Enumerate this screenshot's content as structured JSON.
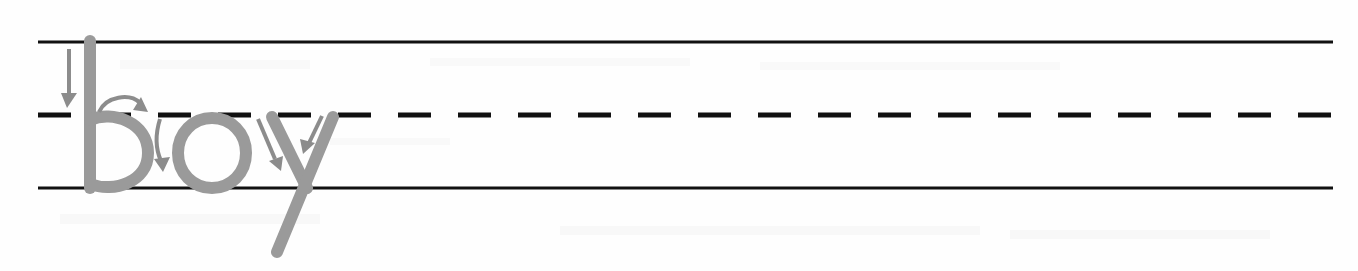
{
  "page": {
    "background_color": "#fefefe",
    "width": 1358,
    "height": 271
  },
  "worksheet": {
    "type": "manuscript-handwriting-practice",
    "word": "boy",
    "letters": [
      "b",
      "o",
      "y"
    ],
    "letter_color": "#9a9a9a",
    "line_color": "#111111",
    "arrow_color": "#8c8c8c",
    "description": "Traceable gray word 'boy' on three-line handwriting guide with numbered stroke-direction arrows"
  },
  "guide_lines": {
    "left_x": 38,
    "right_x": 1333,
    "top_line": {
      "name": "top-solid-line",
      "y": 42,
      "style": "solid",
      "thickness": 3,
      "label": "ascender line"
    },
    "mid_line": {
      "name": "middle-dashed-line",
      "y": 115,
      "style": "dashed",
      "thickness": 5,
      "dash_length": 33,
      "gap_length": 27,
      "label": "midline"
    },
    "baseline": {
      "name": "bottom-solid-line",
      "y": 188,
      "style": "solid",
      "thickness": 3,
      "label": "baseline"
    }
  },
  "strokes": [
    {
      "id": "b-stem",
      "letter": "b",
      "order": 1,
      "description": "vertical downstroke from top line to baseline",
      "color": "#9a9a9a",
      "width": 12,
      "path": "M 90 41 L 90 188"
    },
    {
      "id": "b-bowl",
      "letter": "b",
      "order": 2,
      "description": "round bowl from midline clockwise back to baseline",
      "color": "#9a9a9a",
      "width": 12,
      "path": "M 90 120 C 112 110 148 122 148 153 C 148 182 114 193 90 184"
    },
    {
      "id": "o-circle",
      "letter": "o",
      "order": 3,
      "description": "closed oval from midline counterclockwise",
      "color": "#9a9a9a",
      "width": 12,
      "path": "M 212 118 C 231 118 246 133 246 153 C 246 173 231 188 212 188 C 193 188 178 173 178 153 C 178 133 193 118 212 118 Z"
    },
    {
      "id": "y-left-diagonal",
      "letter": "y",
      "order": 4,
      "description": "diagonal down-right from midline to baseline",
      "color": "#9a9a9a",
      "width": 12,
      "path": "M 272 117 L 307 188"
    },
    {
      "id": "y-right-diagonal-tail",
      "letter": "y",
      "order": 5,
      "description": "diagonal from midline down-left through baseline into descender tail",
      "color": "#9a9a9a",
      "width": 12,
      "path": "M 333 117 L 277 252"
    }
  ],
  "arrows": [
    {
      "id": "arrow-b-stem",
      "for_stroke": "b-stem",
      "direction": "down",
      "color": "#8c8c8c",
      "shaft": "M 69 49 L 69 96",
      "head": "67,108 61,93 77,93"
    },
    {
      "id": "arrow-b-bowl-top",
      "for_stroke": "b-bowl",
      "direction": "curve-right",
      "color": "#8c8c8c",
      "shaft": "M 99 112 C 106 96 130 93 140 103",
      "head": "148,112 133,110 141,97"
    },
    {
      "id": "arrow-b-bowl-down",
      "for_stroke": "b-bowl",
      "direction": "curve-down",
      "color": "#8c8c8c",
      "shaft": "M 160 119 C 154 138 157 152 161 161",
      "head": "163,172 154,159 170,157"
    },
    {
      "id": "arrow-y-left",
      "for_stroke": "y-left-diagonal",
      "direction": "down-right",
      "color": "#8c8c8c",
      "shaft": "M 258 119 L 275 159",
      "head": "281,171 269,161 283,156"
    },
    {
      "id": "arrow-y-right",
      "for_stroke": "y-right-diagonal-tail",
      "direction": "down-left",
      "color": "#8c8c8c",
      "shaft": "M 322 116 L 309 143",
      "head": "303,154 300,139 315,143"
    }
  ]
}
